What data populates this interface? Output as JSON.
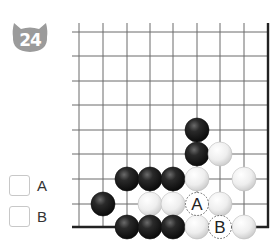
{
  "problem": {
    "number": "24",
    "badge_color": "#9b9b9b"
  },
  "board": {
    "columns_x": [
      79,
      103,
      127,
      150,
      173,
      197,
      220,
      244
    ],
    "rows_y": [
      32,
      56,
      81,
      105,
      130,
      154,
      179,
      204,
      227
    ],
    "right_edge_x": 268,
    "bottom_edge_y": 227,
    "line_top_y": 23,
    "line_left_x": 72,
    "stone_radius": 12,
    "stones": [
      {
        "color": "black",
        "col": 5,
        "row": 4
      },
      {
        "color": "black",
        "col": 5,
        "row": 5
      },
      {
        "color": "white",
        "col": 6,
        "row": 5
      },
      {
        "color": "black",
        "col": 2,
        "row": 6
      },
      {
        "color": "black",
        "col": 3,
        "row": 6
      },
      {
        "color": "black",
        "col": 4,
        "row": 6
      },
      {
        "color": "white",
        "col": 5,
        "row": 6
      },
      {
        "color": "white",
        "col": 7,
        "row": 6
      },
      {
        "color": "black",
        "col": 1,
        "row": 7
      },
      {
        "color": "white",
        "col": 3,
        "row": 7
      },
      {
        "color": "white",
        "col": 4,
        "row": 7
      },
      {
        "color": "white",
        "col": 6,
        "row": 7
      },
      {
        "color": "black",
        "col": 2,
        "row": 8
      },
      {
        "color": "black",
        "col": 3,
        "row": 8
      },
      {
        "color": "black",
        "col": 4,
        "row": 8
      },
      {
        "color": "white",
        "col": 5,
        "row": 8
      },
      {
        "color": "white",
        "col": 7,
        "row": 8
      }
    ],
    "markers": [
      {
        "label": "A",
        "col": 5,
        "row": 7
      },
      {
        "label": "B",
        "col": 6,
        "row": 8
      }
    ]
  },
  "options": [
    {
      "label": "A",
      "checked": false
    },
    {
      "label": "B",
      "checked": false
    }
  ]
}
